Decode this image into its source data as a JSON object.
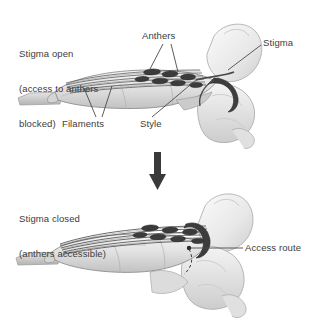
{
  "figure": {
    "background_color": "#ffffff",
    "text_color": "#3c3c3c",
    "arrow_color": "#3a3a3a"
  },
  "panels": {
    "top": {
      "caption_line1": "Stigma open",
      "caption_line2": "(access to anthers",
      "caption_line3": "blocked)",
      "labels": {
        "anthers": "Anthers",
        "stigma": "Stigma",
        "filaments": "Filaments",
        "style": "Style"
      }
    },
    "bottom": {
      "caption_line1": "Stigma closed",
      "caption_line2": "(anthers accessible)",
      "labels": {
        "access_route": "Access route"
      }
    }
  },
  "transition": {
    "icon": "down-arrow-icon"
  },
  "palette": {
    "petal_light": "#f2f2f2",
    "petal_mid": "#d8d8d8",
    "petal_shade": "#bcbcbc",
    "keel_fill": "#cfcfcf",
    "anther_dark": "#3f3f3f",
    "filament_gray": "#6f6f6f",
    "outline": "#8a8a8a",
    "leader_line": "#4a4a4a"
  }
}
